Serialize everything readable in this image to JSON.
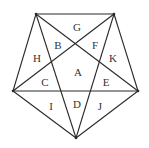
{
  "diagram": {
    "type": "pentagon-with-star",
    "vertices": {
      "top_left": [
        36,
        14
      ],
      "top_right": [
        114,
        14
      ],
      "right": [
        138,
        91
      ],
      "bottom": [
        76,
        138
      ],
      "left": [
        13,
        91
      ]
    },
    "pentagon_edges": [
      [
        "top_left",
        "top_right"
      ],
      [
        "top_right",
        "right"
      ],
      [
        "right",
        "bottom"
      ],
      [
        "bottom",
        "left"
      ],
      [
        "left",
        "top_left"
      ]
    ],
    "diagonals": [
      [
        "top_left",
        "right"
      ],
      [
        "top_left",
        "bottom"
      ],
      [
        "top_right",
        "left"
      ],
      [
        "top_right",
        "bottom"
      ],
      [
        "left",
        "right"
      ]
    ],
    "labels": [
      {
        "text": "G",
        "x": 77,
        "y": 27
      },
      {
        "text": "B",
        "x": 58,
        "y": 45
      },
      {
        "text": "F",
        "x": 95,
        "y": 45
      },
      {
        "text": "H",
        "x": 37,
        "y": 58
      },
      {
        "text": "K",
        "x": 113,
        "y": 58
      },
      {
        "text": "A",
        "x": 78,
        "y": 72
      },
      {
        "text": "C",
        "x": 45,
        "y": 82
      },
      {
        "text": "E",
        "x": 106,
        "y": 82
      },
      {
        "text": "I",
        "x": 51,
        "y": 106
      },
      {
        "text": "D",
        "x": 77,
        "y": 104
      },
      {
        "text": "J",
        "x": 100,
        "y": 106
      }
    ],
    "colors": {
      "line": "#2a2a2a",
      "text": "#333333",
      "background": "#ffffff"
    }
  }
}
